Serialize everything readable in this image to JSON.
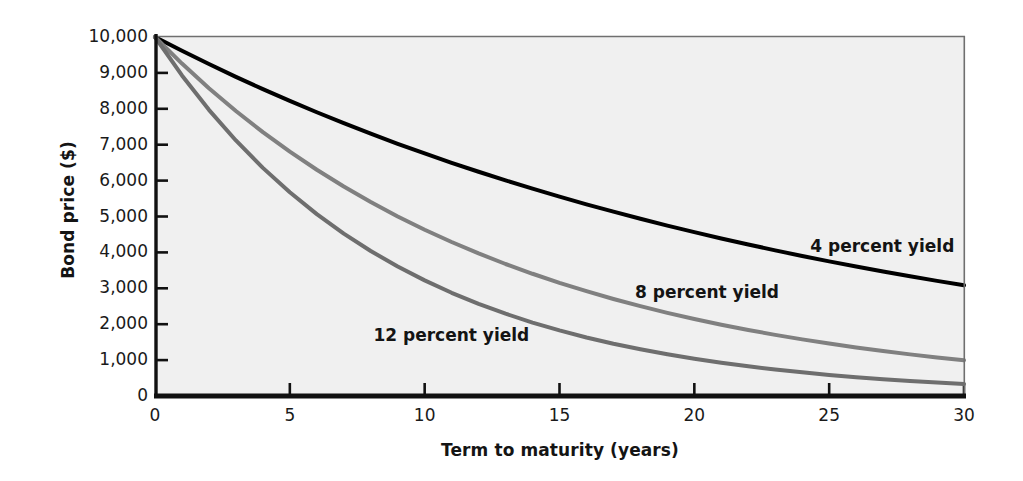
{
  "chart_data": {
    "type": "line",
    "title": "",
    "xlabel": "Term to maturity (years)",
    "ylabel": "Bond price ($)",
    "xlim": [
      0,
      30
    ],
    "ylim": [
      0,
      10000
    ],
    "grid": false,
    "legend_position": "inline-annotations",
    "x_ticks": [
      "0",
      "5",
      "10",
      "15",
      "20",
      "25",
      "30"
    ],
    "x_tick_values": [
      0,
      5,
      10,
      15,
      20,
      25,
      30
    ],
    "y_ticks": [
      "0",
      "1,000",
      "2,000",
      "3,000",
      "4,000",
      "5,000",
      "6,000",
      "7,000",
      "8,000",
      "9,000",
      "10,000"
    ],
    "y_tick_values": [
      0,
      1000,
      2000,
      3000,
      4000,
      5000,
      6000,
      7000,
      8000,
      9000,
      10000
    ],
    "x": [
      0,
      1,
      2,
      3,
      4,
      5,
      6,
      7,
      8,
      9,
      10,
      11,
      12,
      13,
      14,
      15,
      16,
      17,
      18,
      19,
      20,
      21,
      22,
      23,
      24,
      25,
      26,
      27,
      28,
      29,
      30
    ],
    "series": [
      {
        "name": "4 percent yield",
        "color": "#000000",
        "width": 4.0,
        "label_x": 24.3,
        "label_y": 4150,
        "values": [
          10000,
          9615,
          9246,
          8890,
          8548,
          8219,
          7903,
          7599,
          7307,
          7026,
          6756,
          6496,
          6246,
          6006,
          5775,
          5553,
          5339,
          5134,
          4936,
          4746,
          4564,
          4388,
          4220,
          4057,
          3901,
          3751,
          3607,
          3468,
          3335,
          3207,
          3083
        ]
      },
      {
        "name": "8 percent yield",
        "color": "#808080",
        "width": 4.0,
        "label_x": 17.8,
        "label_y": 2880,
        "values": [
          10000,
          9259,
          8573,
          7938,
          7350,
          6806,
          6302,
          5835,
          5403,
          5002,
          4632,
          4289,
          3971,
          3677,
          3405,
          3152,
          2919,
          2703,
          2502,
          2317,
          2145,
          1987,
          1839,
          1703,
          1577,
          1460,
          1352,
          1252,
          1159,
          1073,
          994
        ]
      },
      {
        "name": "12 percent yield",
        "color": "#6e6e6e",
        "width": 4.0,
        "label_x": 8.1,
        "label_y": 1680,
        "values": [
          10000,
          8929,
          7972,
          7118,
          6355,
          5674,
          5066,
          4523,
          4039,
          3606,
          3220,
          2875,
          2567,
          2292,
          2046,
          1827,
          1631,
          1456,
          1300,
          1161,
          1037,
          926,
          826,
          738,
          659,
          588,
          525,
          469,
          419,
          374,
          334
        ]
      }
    ]
  },
  "axes": {
    "background": "#f0f0f0",
    "border_color": "#5a5a5a",
    "axis_color": "#111111"
  }
}
